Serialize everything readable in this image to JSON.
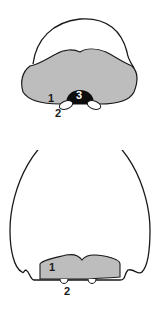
{
  "colors": {
    "outline": "#1a1a1a",
    "shaded": "#bdbdbd",
    "dark": "#0d0d0d",
    "background": "#ffffff"
  },
  "figures": [
    {
      "id": "top",
      "labels": [
        {
          "text": "1",
          "x": 48,
          "y": 102
        },
        {
          "text": "2",
          "x": 55,
          "y": 117
        },
        {
          "text": "3",
          "x": 76,
          "y": 99
        }
      ]
    },
    {
      "id": "bottom",
      "labels": [
        {
          "text": "1",
          "x": 49,
          "y": 121
        },
        {
          "text": "2",
          "x": 64,
          "y": 145
        }
      ]
    }
  ]
}
